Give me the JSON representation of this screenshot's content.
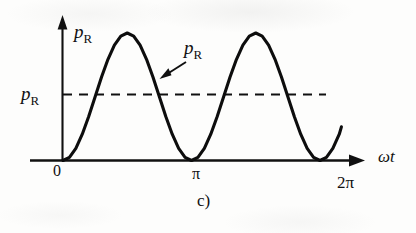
{
  "figure": {
    "caption": "c)",
    "background_color": "#fdfdfc",
    "ink_color": "#101010"
  },
  "axes": {
    "y_axis_label": "p",
    "y_axis_label_sub": "R",
    "x_axis_label": "ωt",
    "origin_label": "0",
    "tick_pi_label": "π",
    "tick_two_pi_label": "2π"
  },
  "annotations": {
    "curve_callout": "p",
    "curve_callout_sub": "R",
    "average_label": "p",
    "average_label_sub": "R"
  },
  "chart_data": {
    "type": "line",
    "title": "",
    "subtitle": "",
    "xlabel": "ωt",
    "ylabel": "p_R",
    "xlim": [
      0,
      6.8068
    ],
    "ylim": [
      0,
      1.12
    ],
    "grid": false,
    "legend": null,
    "xticks": [
      0,
      3.1416,
      6.2832
    ],
    "xticklabels": [
      "0",
      "π",
      "2π"
    ],
    "yticks": [],
    "yticklabels": [],
    "series": [
      {
        "name": "p_R instantaneous power",
        "style": "solid",
        "formula": "p_R = P_max * sin^2(ωt)",
        "x": [
          0.0,
          0.1571,
          0.3142,
          0.4712,
          0.6283,
          0.7854,
          0.9425,
          1.0996,
          1.2566,
          1.4137,
          1.5708,
          1.7279,
          1.885,
          2.042,
          2.1991,
          2.3562,
          2.5133,
          2.6704,
          2.8274,
          2.9845,
          3.1416,
          3.2987,
          3.4558,
          3.6128,
          3.7699,
          3.927,
          4.0841,
          4.2412,
          4.3982,
          4.5553,
          4.7124,
          4.8695,
          5.0265,
          5.1836,
          5.3407,
          5.4978,
          5.6549,
          5.8119,
          5.969,
          6.1261,
          6.2832,
          6.4403,
          6.5973,
          6.7544,
          6.8068
        ],
        "y": [
          0.0,
          0.0245,
          0.0955,
          0.2061,
          0.3455,
          0.5,
          0.6545,
          0.7939,
          0.9045,
          0.9755,
          1.0,
          0.9755,
          0.9045,
          0.7939,
          0.6545,
          0.5,
          0.3455,
          0.2061,
          0.0955,
          0.0245,
          0.0,
          0.0245,
          0.0955,
          0.2061,
          0.3455,
          0.5,
          0.6545,
          0.7939,
          0.9045,
          0.9755,
          1.0,
          0.9755,
          0.9045,
          0.7939,
          0.6545,
          0.5,
          0.3455,
          0.2061,
          0.0955,
          0.0245,
          0.0,
          0.0245,
          0.0955,
          0.2061,
          0.2642
        ]
      },
      {
        "name": "average power p_R",
        "style": "dashed",
        "constant_y": 0.5,
        "x_start": 0.0,
        "x_end": 5.98
      }
    ],
    "annotations": [
      {
        "text": "p_R",
        "type": "arrow-callout",
        "points_to_x": 2.28,
        "points_to_y": 0.6
      },
      {
        "text": "p_R",
        "type": "axis-label",
        "at": "y-axis-top"
      },
      {
        "text": "p_R",
        "type": "level-label",
        "at": "left-of-dashed-line",
        "value_y": 0.5
      }
    ]
  }
}
